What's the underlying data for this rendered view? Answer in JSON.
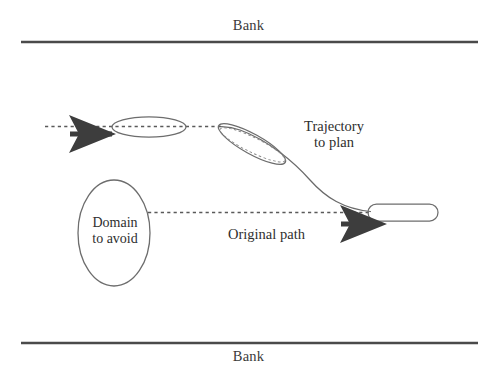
{
  "figure": {
    "kind": "technical-diagram",
    "background_color": "#ffffff",
    "ink_color": "#555555",
    "text_color": "#2e2e2e",
    "arrow_color": "#3d3d3d",
    "width": 497,
    "height": 375
  },
  "labels": {
    "bank_top": "Bank",
    "bank_bottom": "Bank",
    "trajectory_line1": "Trajectory",
    "trajectory_line2": "to plan",
    "original_path": "Original path",
    "domain_line1": "Domain",
    "domain_line2": "to avoid"
  },
  "geometry": {
    "bank_top": {
      "x1": 21,
      "y1": 42,
      "x2": 478,
      "y2": 42
    },
    "bank_bottom": {
      "x1": 21,
      "y1": 343,
      "x2": 478,
      "y2": 343
    },
    "upper_dotted_path": {
      "x1": 45,
      "y1": 126.5,
      "x2": 222,
      "y2": 126.5
    },
    "lower_dotted_path": {
      "x1": 148,
      "y1": 212.5,
      "x2": 370,
      "y2": 212.5
    },
    "vessel_left": {
      "cx": 149,
      "cy": 127,
      "rx": 37,
      "ry": 10,
      "rotation_deg": 0
    },
    "vessel_middle": {
      "cx": 252,
      "cy": 144,
      "rx": 38,
      "ry": 10,
      "rotation_deg": 29
    },
    "vessel_right": {
      "x": 368,
      "y": 204,
      "w": 70,
      "h": 17,
      "radius": 8.5
    },
    "domain_ellipse": {
      "cx": 114,
      "cy": 233,
      "rx": 36,
      "ry": 53
    },
    "arrow_upper": {
      "tip_x": 65,
      "tail_x": 112,
      "y": 134
    },
    "arrow_lower": {
      "tip_x": 335,
      "tail_x": 373,
      "y": 224
    },
    "trajectory_curve": {
      "start": [
        370,
        212
      ],
      "control1": [
        330,
        208
      ],
      "control2": [
        300,
        168
      ],
      "control3": [
        222,
        127
      ]
    }
  }
}
